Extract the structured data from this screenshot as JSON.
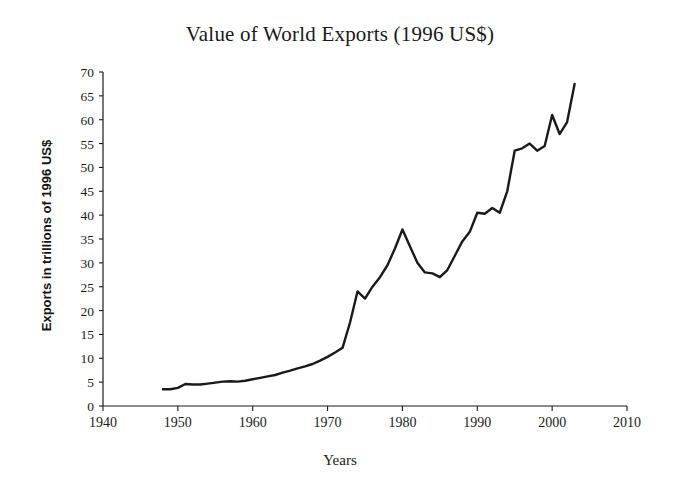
{
  "chart_data": {
    "type": "line",
    "title": "Value of World Exports (1996 US$)",
    "xlabel": "Years",
    "ylabel": "Exports in trillions of 1996 US$",
    "xlim": [
      1940,
      2010
    ],
    "ylim": [
      0,
      70
    ],
    "xticks": [
      1940,
      1950,
      1960,
      1970,
      1980,
      1990,
      2000,
      2010
    ],
    "yticks": [
      0,
      5,
      10,
      15,
      20,
      25,
      30,
      35,
      40,
      45,
      50,
      55,
      60,
      65,
      70
    ],
    "grid": false,
    "legend": false,
    "line_color": "#1a1a1a",
    "line_width": 2.4,
    "background_color": "#ffffff",
    "series": [
      {
        "name": "World exports",
        "x": [
          1948,
          1949,
          1950,
          1951,
          1952,
          1953,
          1954,
          1955,
          1956,
          1957,
          1958,
          1959,
          1960,
          1961,
          1962,
          1963,
          1964,
          1965,
          1966,
          1967,
          1968,
          1969,
          1970,
          1971,
          1972,
          1973,
          1974,
          1975,
          1976,
          1977,
          1978,
          1979,
          1980,
          1981,
          1982,
          1983,
          1984,
          1985,
          1986,
          1987,
          1988,
          1989,
          1990,
          1991,
          1992,
          1993,
          1994,
          1995,
          1996,
          1997,
          1998,
          1999,
          2000,
          2001,
          2002,
          2003
        ],
        "y": [
          3.5,
          3.5,
          3.8,
          4.6,
          4.5,
          4.5,
          4.7,
          4.9,
          5.1,
          5.2,
          5.1,
          5.3,
          5.6,
          5.9,
          6.2,
          6.5,
          7.0,
          7.4,
          7.9,
          8.3,
          8.8,
          9.5,
          10.3,
          11.2,
          12.2,
          17.5,
          24.0,
          22.5,
          25.0,
          27.0,
          29.5,
          33.0,
          37.0,
          33.5,
          30.0,
          28.0,
          27.8,
          27.0,
          28.5,
          31.5,
          34.5,
          36.5,
          40.5,
          40.3,
          41.5,
          40.5,
          45.0,
          53.5,
          54.0,
          55.0,
          53.5,
          54.5,
          61.0,
          57.0,
          59.5,
          67.5
        ]
      }
    ],
    "annotations": []
  }
}
